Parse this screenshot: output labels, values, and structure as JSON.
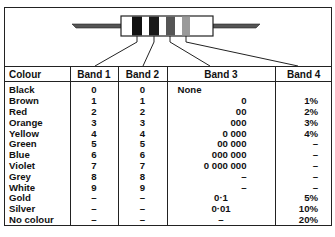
{
  "diagram": {
    "bands": [
      {
        "label": "Band 1",
        "fill": "#111111"
      },
      {
        "label": "Band 2",
        "fill": "#1a1a1a"
      },
      {
        "label": "Band 3",
        "fill": "#555555"
      },
      {
        "label": "Band 4",
        "fill": "#9a9a9a"
      }
    ]
  },
  "table": {
    "headers": [
      "Colour",
      "Band 1",
      "Band 2",
      "Band 3",
      "Band 4"
    ],
    "rows": [
      {
        "colour": "Black",
        "band1": "0",
        "band2": "0",
        "band3": "None",
        "band4": ""
      },
      {
        "colour": "Brown",
        "band1": "1",
        "band2": "1",
        "band3": "0",
        "band4": "1%"
      },
      {
        "colour": "Red",
        "band1": "2",
        "band2": "2",
        "band3": "00",
        "band4": "2%"
      },
      {
        "colour": "Orange",
        "band1": "3",
        "band2": "3",
        "band3": "000",
        "band4": "3%"
      },
      {
        "colour": "Yellow",
        "band1": "4",
        "band2": "4",
        "band3": "0 000",
        "band4": "4%"
      },
      {
        "colour": "Green",
        "band1": "5",
        "band2": "5",
        "band3": "00 000",
        "band4": "–"
      },
      {
        "colour": "Blue",
        "band1": "6",
        "band2": "6",
        "band3": "000 000",
        "band4": "–"
      },
      {
        "colour": "Violet",
        "band1": "7",
        "band2": "7",
        "band3": "0 000 000",
        "band4": "–"
      },
      {
        "colour": "Grey",
        "band1": "8",
        "band2": "8",
        "band3": "–",
        "band4": "–"
      },
      {
        "colour": "White",
        "band1": "9",
        "band2": "9",
        "band3": "–",
        "band4": "–"
      },
      {
        "colour": "Gold",
        "band1": "–",
        "band2": "–",
        "band3": "0·1",
        "band4": "5%"
      },
      {
        "colour": "Silver",
        "band1": "–",
        "band2": "–",
        "band3": "0·01",
        "band4": "10%"
      },
      {
        "colour": "No colour",
        "band1": "–",
        "band2": "–",
        "band3": "–",
        "band4": "20%"
      }
    ]
  }
}
